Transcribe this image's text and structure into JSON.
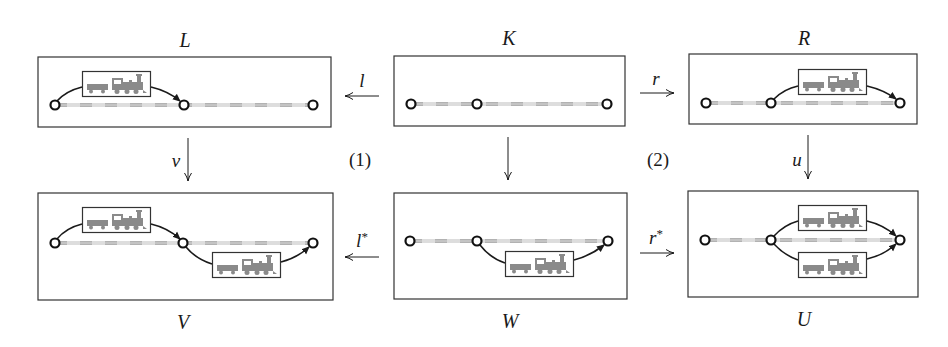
{
  "objects": {
    "L": {
      "label": "L"
    },
    "K": {
      "label": "K"
    },
    "R": {
      "label": "R"
    },
    "V": {
      "label": "V"
    },
    "W": {
      "label": "W"
    },
    "U": {
      "label": "U"
    }
  },
  "morphisms": {
    "l": {
      "label": "l",
      "from": "K",
      "to": "L"
    },
    "r": {
      "label": "r",
      "from": "K",
      "to": "R"
    },
    "v": {
      "label": "v",
      "from": "L",
      "to": "V"
    },
    "k": {
      "label": "",
      "from": "K",
      "to": "W"
    },
    "u": {
      "label": "u",
      "from": "R",
      "to": "U"
    },
    "l_star": {
      "label": "l",
      "sup": "*",
      "from": "W",
      "to": "V"
    },
    "r_star": {
      "label": "r",
      "sup": "*",
      "from": "W",
      "to": "U"
    }
  },
  "squares": {
    "one": "(1)",
    "two": "(2)"
  },
  "colors": {
    "stroke": "#1a1a1a",
    "train": "#8a8a8a",
    "track_dash": "#9a9a9a"
  }
}
